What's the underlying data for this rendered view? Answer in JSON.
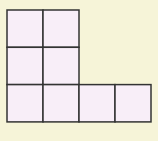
{
  "diagram": {
    "type": "square-grid-shape",
    "cell_size_px": 36,
    "origin_px": [
      7,
      10
    ],
    "colors": {
      "background": "#f6f4d8",
      "cell_fill": "#f8eef8",
      "stroke": "#333333"
    },
    "cells": [
      {
        "row": 0,
        "col": 0
      },
      {
        "row": 0,
        "col": 1
      },
      {
        "row": 1,
        "col": 0
      },
      {
        "row": 1,
        "col": 1
      },
      {
        "row": 2,
        "col": 0
      },
      {
        "row": 2,
        "col": 1
      },
      {
        "row": 2,
        "col": 2
      },
      {
        "row": 2,
        "col": 3
      }
    ],
    "cell_count": 8
  }
}
